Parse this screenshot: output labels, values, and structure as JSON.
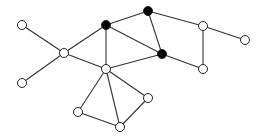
{
  "graph": {
    "nodes": [
      {
        "id": "A",
        "x": 22,
        "y": 25,
        "filled": false
      },
      {
        "id": "B",
        "x": 106,
        "y": 25,
        "filled": true
      },
      {
        "id": "C",
        "x": 64,
        "y": 53,
        "filled": false
      },
      {
        "id": "D",
        "x": 22,
        "y": 83,
        "filled": false
      },
      {
        "id": "E",
        "x": 106,
        "y": 69,
        "filled": false
      },
      {
        "id": "F",
        "x": 78,
        "y": 112,
        "filled": false
      },
      {
        "id": "G",
        "x": 120,
        "y": 127,
        "filled": false
      },
      {
        "id": "H",
        "x": 148,
        "y": 11,
        "filled": true
      },
      {
        "id": "I",
        "x": 162,
        "y": 54,
        "filled": true
      },
      {
        "id": "J",
        "x": 203,
        "y": 26,
        "filled": false
      },
      {
        "id": "K",
        "x": 245,
        "y": 40,
        "filled": false
      },
      {
        "id": "L",
        "x": 203,
        "y": 69,
        "filled": false
      },
      {
        "id": "M",
        "x": 148,
        "y": 98,
        "filled": false
      }
    ],
    "edges": [
      [
        "A",
        "C"
      ],
      [
        "D",
        "C"
      ],
      [
        "C",
        "B"
      ],
      [
        "C",
        "E"
      ],
      [
        "B",
        "E"
      ],
      [
        "B",
        "H"
      ],
      [
        "B",
        "I"
      ],
      [
        "H",
        "I"
      ],
      [
        "E",
        "I"
      ],
      [
        "E",
        "F"
      ],
      [
        "E",
        "G"
      ],
      [
        "E",
        "M"
      ],
      [
        "F",
        "G"
      ],
      [
        "G",
        "M"
      ],
      [
        "H",
        "J"
      ],
      [
        "J",
        "K"
      ],
      [
        "J",
        "L"
      ],
      [
        "I",
        "L"
      ]
    ],
    "style": {
      "edge_color": "#333333",
      "node_stroke": "#222222",
      "filled_color": "#000000",
      "empty_color": "#ffffff",
      "node_radius": 4.5
    }
  }
}
